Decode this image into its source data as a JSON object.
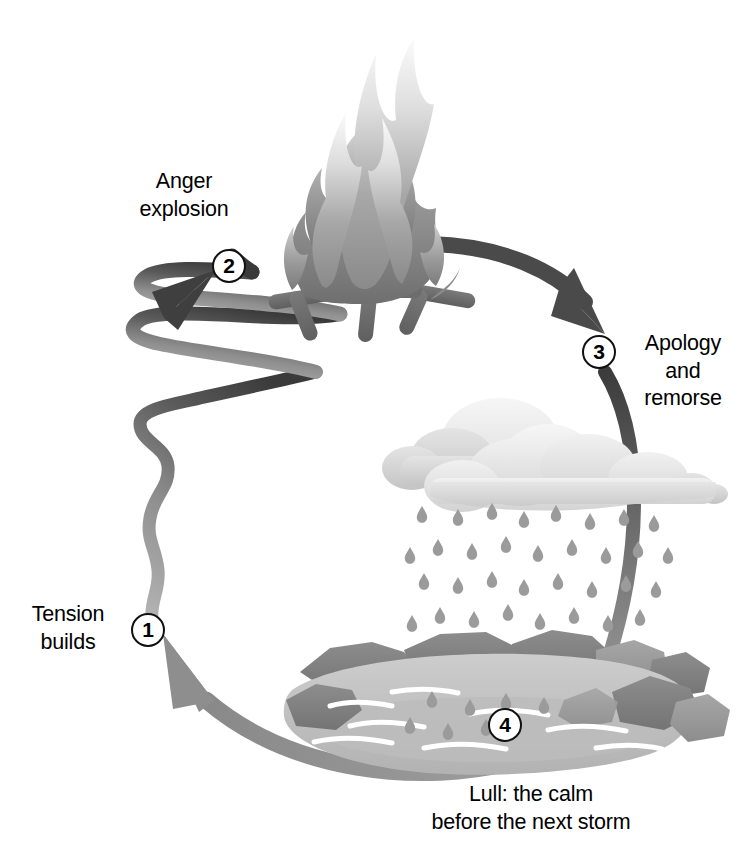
{
  "diagram": {
    "type": "cycle",
    "direction": "clockwise",
    "background_color": "#ffffff",
    "text_color": "#000000",
    "stages": [
      {
        "number": "1",
        "label": "Tension\nbuilds",
        "label_lines": [
          "Tension",
          "builds"
        ],
        "icon": "zigzag-arrow-icon",
        "position": "left"
      },
      {
        "number": "2",
        "label": "Anger\nexplosion",
        "label_lines": [
          "Anger",
          "explosion"
        ],
        "icon": "campfire-icon",
        "position": "top"
      },
      {
        "number": "3",
        "label": "Apology\nand\nremorse",
        "label_lines": [
          "Apology",
          "and",
          "remorse"
        ],
        "icon": "rain-cloud-icon",
        "position": "right"
      },
      {
        "number": "4",
        "label": "Lull: the calm\nbefore the next storm",
        "label_lines": [
          "Lull: the calm",
          "before the next storm"
        ],
        "icon": "calm-pond-icon",
        "position": "bottom"
      }
    ],
    "connectors": [
      {
        "name": "tension-zigzag-arrow",
        "from": "1",
        "to": "2",
        "style": "zigzag",
        "color_start": "#a0a0a0",
        "color_end": "#3f3f3f"
      },
      {
        "name": "explosion-to-apology-arc",
        "from": "2",
        "to": "3",
        "style": "curved",
        "color": "#4a4a4a"
      },
      {
        "name": "apology-to-lull-arc",
        "from": "3",
        "to": "4",
        "style": "curved",
        "color_start": "#3f3f3f",
        "color_end": "#9a9a9a"
      },
      {
        "name": "lull-to-tension-arc",
        "from": "4",
        "to": "1",
        "style": "curved",
        "color": "#8e8e8e"
      }
    ],
    "palette": {
      "flame_light": "#f2f2f2",
      "flame_mid": "#b8b8b8",
      "flame_dark": "#7d7d7d",
      "log_dark": "#6a6a6a",
      "cloud_light": "#ececec",
      "cloud_mid": "#d6d6d6",
      "cloud_shadow": "#c2c2c2",
      "raindrop": "#9b9b9b",
      "rock_dark": "#8a8a8a",
      "rock_mid": "#9e9e9e",
      "water_light": "#c9c9c9",
      "water_mid": "#b4b4b4",
      "ripple_white": "#ffffff"
    }
  }
}
